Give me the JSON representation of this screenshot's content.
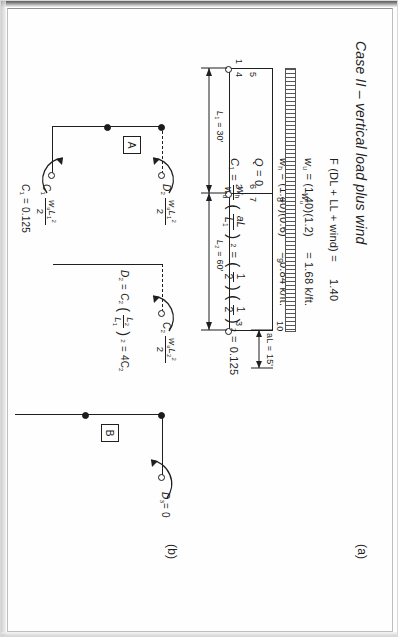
{
  "document": {
    "title": "Case II – vertical load plus wind",
    "panel_a_label": "(a)",
    "panel_b_label": "(b)"
  },
  "equations": {
    "line1_lhs": "F (DL + LL + wind)",
    "line1_eq": "=",
    "line1_rhs": "1.40",
    "line2_sym": "w",
    "line2_sub": "u",
    "line2_eq": "=",
    "line2_expr": "(1.40)(1.2)",
    "line2_eq2": "=",
    "line2_val": "1.68 k/ft.",
    "line3_sym": "w",
    "line3_sub": "h",
    "line3_eq": "=",
    "line3_expr": "(1.40)(0.6)",
    "line3_eq2": "=",
    "line3_val": "0.84 k/ft.",
    "line4_sym": "Q",
    "line4_eq": "=",
    "line4_val": "0",
    "line5_sym": "C",
    "line5_sub": "1",
    "line5_eq": "=",
    "line5_frac_num": "w",
    "line5_frac_num_sub": "h",
    "line5_frac_den": "w",
    "line5_frac_den_sub": "u",
    "line5_ratio_num": "aL",
    "line5_ratio_den": "L",
    "line5_ratio_den_sub": "1",
    "line5_exp": "2",
    "line5_eq2": "=",
    "line5_half_num": "1",
    "line5_half_den": "2",
    "line5_half2_num": "1",
    "line5_half2_den": "2",
    "line5_exp2": "2",
    "line5_eq3": "=",
    "line5_result": "0.125"
  },
  "frame": {
    "load_label_sym": "w",
    "load_label_sub": "u",
    "dim_aL": "aL = 15'",
    "dim_L1": "L",
    "dim_L1_sub": "1",
    "dim_L1_val": "= 30'",
    "dim_L2": "L",
    "dim_L2_sub": "2",
    "dim_L2_val": "= 60'",
    "nodes": [
      "1",
      "2",
      "3",
      "4",
      "5",
      "6",
      "7",
      "8",
      "9",
      "10"
    ]
  },
  "panel_b": {
    "label_A": "A",
    "label_B": "B",
    "moment_C1_sym": "C",
    "moment_C1_sub": "1",
    "moment_C1_num_sym": "w",
    "moment_C1_num_sub": "u",
    "moment_C1_num_L": "L",
    "moment_C1_num_Lsub": "1",
    "moment_C1_num_exp": "2",
    "moment_C1_den": "2",
    "moment_D2_sym": "D",
    "moment_D2_sub": "2",
    "moment_D2_num_sym": "w",
    "moment_D2_num_sub": "u",
    "moment_D2_num_L": "L",
    "moment_D2_num_Lsub": "1",
    "moment_D2_num_exp": "2",
    "moment_D2_den": "2",
    "moment_C2_sym": "C",
    "moment_C2_sub": "2",
    "moment_C2_num_sym": "w",
    "moment_C2_num_sub": "u",
    "moment_C2_num_L": "L",
    "moment_C2_num_Lsub": "2",
    "moment_C2_num_exp": "2",
    "moment_C2_den": "2",
    "result_C1": "C",
    "result_C1_sub": "1",
    "result_C1_eq": "= 0.125",
    "result_D2_sym": "D",
    "result_D2_sub": "2",
    "result_D2_eq": "=",
    "result_D2_C": "C",
    "result_D2_Csub": "2",
    "result_D2_ratio_num": "L",
    "result_D2_ratio_num_sub": "2",
    "result_D2_ratio_den": "L",
    "result_D2_ratio_den_sub": "1",
    "result_D2_exp": "2",
    "result_D2_eq2": "=",
    "result_D2_val": "4C",
    "result_D2_valsub": "2",
    "result_D3_sym": "D",
    "result_D3_sub": "3",
    "result_D3_eq": "= 0"
  }
}
